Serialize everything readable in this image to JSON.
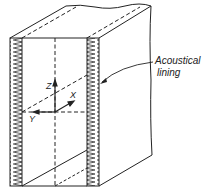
{
  "diagram": {
    "type": "isometric duct section",
    "label": {
      "line1": "Acoustical",
      "line2": "lining"
    },
    "axes": {
      "z": "Z",
      "x": "X",
      "y": "Y"
    },
    "colors": {
      "stroke": "#222222",
      "background": "#ffffff"
    }
  }
}
